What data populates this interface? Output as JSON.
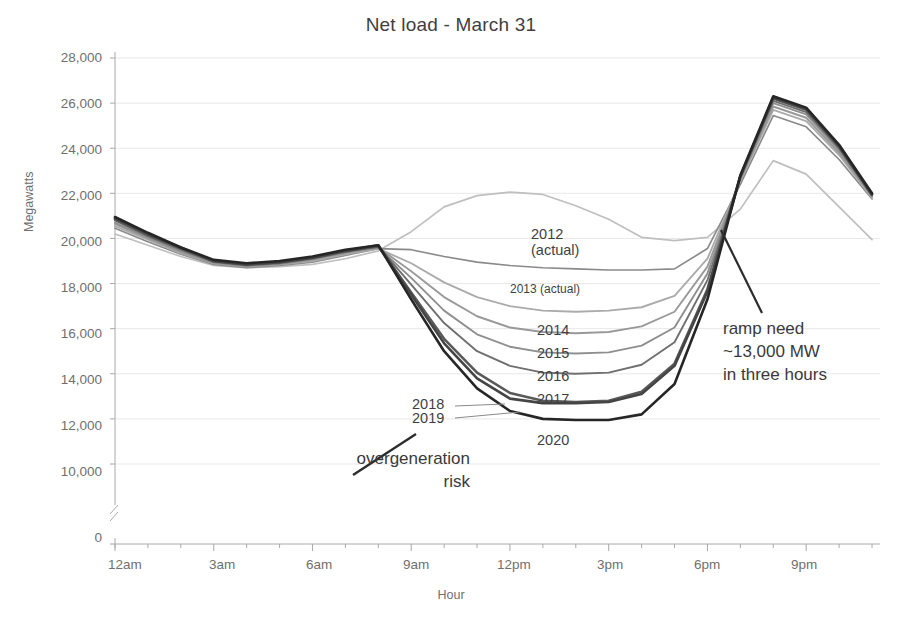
{
  "chart_data": {
    "type": "line",
    "title": "Net load - March 31",
    "xlabel": "Hour",
    "ylabel": "Megawatts",
    "grid": true,
    "legend_position": "inline-labels",
    "axis_break": true,
    "axis_break_note": "y-axis broken between 0 and 10,000",
    "x": [
      "12am",
      "1am",
      "2am",
      "3am",
      "4am",
      "5am",
      "6am",
      "7am",
      "8am",
      "9am",
      "10am",
      "11am",
      "12pm",
      "1pm",
      "2pm",
      "3pm",
      "4pm",
      "5pm",
      "6pm",
      "7pm",
      "8pm",
      "9pm",
      "10pm",
      "11pm"
    ],
    "xtick_labels": [
      "12am",
      "3am",
      "6am",
      "9am",
      "12pm",
      "3pm",
      "6pm",
      "9pm"
    ],
    "ytick_labels": [
      "0",
      "10,000",
      "12,000",
      "14,000",
      "16,000",
      "18,000",
      "20,000",
      "22,000",
      "24,000",
      "26,000",
      "28,000"
    ],
    "ylim": [
      10000,
      28000
    ],
    "series": [
      {
        "name": "2012 (actual)",
        "label": "2012",
        "label_line2": "(actual)",
        "color": "#bfbfbf",
        "values": [
          20200,
          19700,
          19200,
          18800,
          18700,
          18750,
          18850,
          19100,
          19450,
          20300,
          21400,
          21900,
          22050,
          21950,
          21450,
          20850,
          20050,
          19900,
          20050,
          21300,
          23450,
          22850,
          21400,
          19950
        ]
      },
      {
        "name": "2013 (actual)",
        "label": "2013 (actual)",
        "color": "#8a8a8a",
        "values": [
          20450,
          19850,
          19300,
          18850,
          18700,
          18800,
          18950,
          19250,
          19550,
          19500,
          19200,
          18950,
          18800,
          18700,
          18650,
          18600,
          18600,
          18650,
          19550,
          22400,
          25450,
          24950,
          23500,
          21750
        ]
      },
      {
        "name": "2014",
        "label": "2014",
        "color": "#ababab",
        "values": [
          20550,
          19950,
          19350,
          18900,
          18750,
          18850,
          19000,
          19300,
          19550,
          18900,
          18050,
          17400,
          17000,
          16800,
          16750,
          16800,
          16950,
          17450,
          19100,
          22550,
          25700,
          25200,
          23700,
          21800
        ]
      },
      {
        "name": "2015",
        "label": "2015",
        "color": "#999999",
        "values": [
          20650,
          20000,
          19400,
          18900,
          18750,
          18850,
          19050,
          19350,
          19600,
          18550,
          17400,
          16550,
          16050,
          15850,
          15800,
          15850,
          16100,
          16750,
          18750,
          22600,
          25850,
          25350,
          23800,
          21850
        ]
      },
      {
        "name": "2016",
        "label": "2016",
        "color": "#8f8f8f",
        "values": [
          20700,
          20050,
          19450,
          18950,
          18800,
          18900,
          19100,
          19400,
          19600,
          18250,
          16800,
          15750,
          15200,
          14950,
          14900,
          14950,
          15250,
          16050,
          18450,
          22650,
          26000,
          25500,
          23900,
          21900
        ]
      },
      {
        "name": "2017",
        "label": "2017",
        "color": "#6f6f6f",
        "values": [
          20800,
          20100,
          19500,
          18950,
          18800,
          18900,
          19100,
          19400,
          19650,
          17950,
          16250,
          15000,
          14350,
          14050,
          14000,
          14050,
          14400,
          15400,
          18150,
          22700,
          26100,
          25600,
          24000,
          21900
        ]
      },
      {
        "name": "2018",
        "label": "2018",
        "color": "#5a5a5a",
        "values": [
          20850,
          20150,
          19550,
          19000,
          18850,
          18950,
          19150,
          19450,
          19650,
          17600,
          15550,
          14050,
          13150,
          12800,
          12750,
          12800,
          13200,
          14450,
          17750,
          22750,
          26200,
          25700,
          24050,
          21950
        ]
      },
      {
        "name": "2019",
        "label": "2019",
        "color": "#454545",
        "values": [
          20900,
          20200,
          19600,
          19000,
          18850,
          18950,
          19150,
          19450,
          19700,
          17500,
          15350,
          13800,
          12900,
          12700,
          12700,
          12750,
          13100,
          14350,
          17650,
          22750,
          26250,
          25750,
          24100,
          21950
        ]
      },
      {
        "name": "2020",
        "label": "2020",
        "color": "#262626",
        "values": [
          20950,
          20250,
          19600,
          19050,
          18900,
          19000,
          19200,
          19500,
          19700,
          17300,
          15000,
          13350,
          12350,
          12000,
          11950,
          11950,
          12200,
          13550,
          17300,
          22800,
          26300,
          25800,
          24150,
          22000
        ]
      }
    ],
    "annotations": [
      {
        "name": "ramp-need",
        "text_lines": [
          "ramp need",
          "~13,000 MW",
          "in three hours"
        ]
      },
      {
        "name": "overgeneration-risk",
        "text_lines": [
          "overgeneration",
          "risk"
        ]
      }
    ]
  },
  "colors": {
    "background": "#ffffff",
    "grid": "#e8e8e8",
    "axis": "#a8a8a8",
    "text": "#4a4a4a",
    "title": "#3f3f3f"
  }
}
